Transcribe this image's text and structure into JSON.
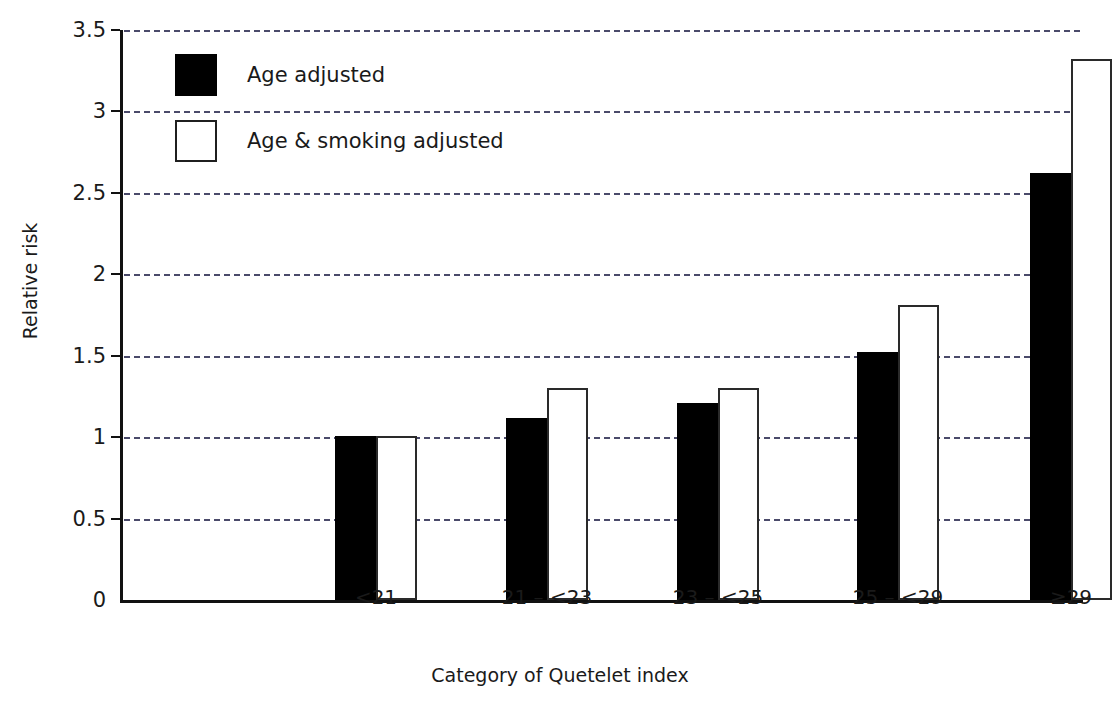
{
  "chart_data": {
    "type": "bar",
    "title": "",
    "xlabel": "Category of Quetelet index",
    "ylabel": "Relative risk",
    "categories": [
      "<21",
      "21 – <23",
      "23 – <25",
      "25 – <29",
      "≥29"
    ],
    "series": [
      {
        "name": "Age adjusted",
        "values": [
          1.01,
          1.12,
          1.21,
          1.52,
          2.62
        ],
        "color": "#000000",
        "style": "filled"
      },
      {
        "name": "Age & smoking adjusted",
        "values": [
          1.01,
          1.3,
          1.3,
          1.81,
          3.32
        ],
        "color": "#ffffff",
        "style": "hollow"
      }
    ],
    "ylim": [
      0,
      3.5
    ],
    "yticks": [
      0,
      0.5,
      1,
      1.5,
      2,
      2.5,
      3,
      3.5
    ],
    "ytick_labels": [
      "0",
      "0.5",
      "1",
      "1.5",
      "2",
      "2.5",
      "3",
      "3.5"
    ],
    "grid": true,
    "grid_style": "dashed",
    "grid_axis": "y",
    "legend_position": "top-left"
  },
  "legend": {
    "items": [
      {
        "label": "Age adjusted",
        "style": "filled"
      },
      {
        "label": "Age & smoking adjusted",
        "style": "hollow"
      }
    ]
  },
  "axes": {
    "y_title": "Relative risk",
    "x_title": "Category of Quetelet index"
  },
  "colors": {
    "series_filled": "#000000",
    "series_hollow": "#ffffff",
    "axis": "#111111",
    "grid": "#4a4a6a",
    "text": "#1a1a1a",
    "background": "#ffffff"
  }
}
